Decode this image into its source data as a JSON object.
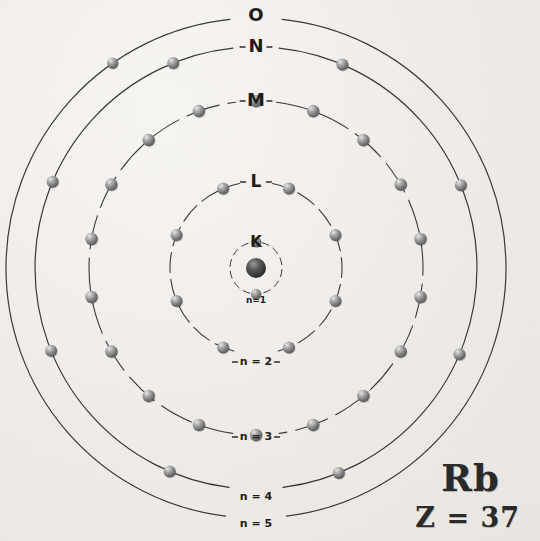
{
  "figure": {
    "element_symbol": "Rb",
    "atomic_number_label": "Z = 37",
    "background_color": "#f2f0ed",
    "ink_color": "#3a3a3a",
    "electron_color": "#8a8a8a"
  },
  "nucleus": {
    "label": "nucleus",
    "cx": 256,
    "cy": 268,
    "r": 10
  },
  "shells": [
    {
      "letter": "K",
      "n_label": "n=1",
      "n": 1,
      "radius": 26,
      "electron_count": 2,
      "letter_x": 256,
      "letter_y": 242,
      "letter_size": 15,
      "n_label_x": 256,
      "n_label_y": 300,
      "n_label_size": 9,
      "gap_top_deg": 14,
      "gap_bottom_deg": 14,
      "electron_angles": [
        180,
        0
      ],
      "electron_r": 5.2
    },
    {
      "letter": "L",
      "n_label": "n = 2",
      "n": 2,
      "radius": 86,
      "electron_count": 8,
      "letter_x": 256,
      "letter_y": 182,
      "letter_size": 17,
      "n_label_x": 256,
      "n_label_y": 362,
      "n_label_size": 11,
      "gap_top_deg": 11,
      "gap_bottom_deg": 15,
      "electron_angles": [
        247.5,
        292.5,
        337.5,
        22.5,
        67.5,
        112.5,
        157.5,
        202.5
      ],
      "electron_r": 6.0
    },
    {
      "letter": "M",
      "n_label": "n = 3",
      "n": 3,
      "radius": 167,
      "electron_count": 18,
      "letter_x": 256,
      "letter_y": 101,
      "letter_size": 18,
      "n_label_x": 256,
      "n_label_y": 437,
      "n_label_size": 11,
      "gap_top_deg": 7,
      "gap_bottom_deg": 8,
      "electron_angles": [
        260,
        280,
        300,
        320,
        340,
        0,
        20,
        40,
        60,
        80,
        100,
        120,
        140,
        160,
        180,
        200,
        220,
        240
      ],
      "electron_r": 6.2
    },
    {
      "letter": "N",
      "n_label": "n = 4",
      "n": 4,
      "radius": 221,
      "electron_count": 8,
      "letter_x": 256,
      "letter_y": 47,
      "letter_size": 18,
      "n_label_x": 256,
      "n_label_y": 497,
      "n_label_size": 11,
      "gap_top_deg": 6,
      "gap_bottom_deg": 7,
      "electron_angles": [
        248,
        293,
        338,
        23,
        68,
        113,
        158,
        203
      ],
      "electron_r": 6.0
    },
    {
      "letter": "O",
      "n_label": "n = 5",
      "n": 5,
      "radius": 250,
      "electron_count": 1,
      "letter_x": 256,
      "letter_y": 16,
      "letter_size": 18,
      "n_label_x": 256,
      "n_label_y": 524,
      "n_label_size": 11,
      "gap_top_deg": 6,
      "gap_bottom_deg": 7,
      "electron_angles": [
        325
      ],
      "electron_r": 5.6
    }
  ],
  "electron_configuration_summary": {
    "total_electrons": 37,
    "per_shell": [
      2,
      8,
      18,
      8,
      1
    ]
  }
}
